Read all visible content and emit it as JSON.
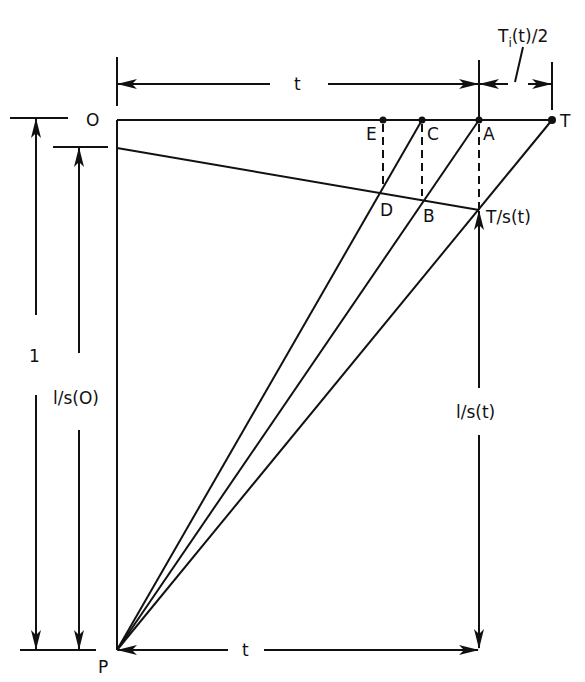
{
  "diagram": {
    "type": "geometric construction",
    "colors": {
      "ink": "#111111",
      "background": "#ffffff"
    },
    "points": {
      "O": {
        "label": "O",
        "x": 117,
        "y": 120
      },
      "P": {
        "label": "P",
        "x": 117,
        "y": 650
      },
      "E": {
        "label": "E",
        "x": 383,
        "y": 120
      },
      "C": {
        "label": "C",
        "x": 422,
        "y": 120
      },
      "A": {
        "label": "A",
        "x": 479,
        "y": 120
      },
      "T": {
        "label": "T",
        "x": 552,
        "y": 120
      },
      "D": {
        "label": "D",
        "x": 383,
        "y": 188
      },
      "B": {
        "label": "B",
        "x": 422,
        "y": 196
      },
      "Ts": {
        "label": "T/s(t)",
        "x": 479,
        "y": 210
      }
    },
    "dimensions": {
      "top_t": {
        "label": "t"
      },
      "top_Ti": {
        "label": "T",
        "sub": "i",
        "suffix": "(t)/2"
      },
      "left_1": {
        "label": "1"
      },
      "left_ls0": {
        "label": "l/s(O)"
      },
      "right_lst": {
        "label": "l/s(t)"
      },
      "bottom_t": {
        "label": "t"
      }
    }
  }
}
